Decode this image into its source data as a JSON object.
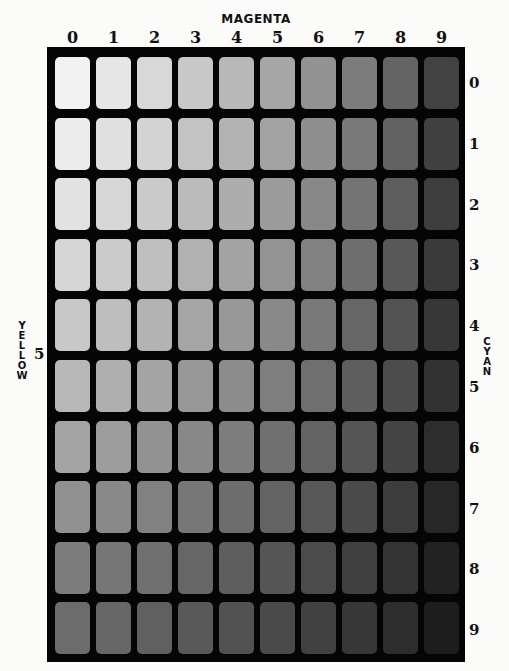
{
  "title": "MAGENTA",
  "columns": {
    "axis": "MAGENTA",
    "labels": [
      "0",
      "1",
      "2",
      "3",
      "4",
      "5",
      "6",
      "7",
      "8",
      "9"
    ]
  },
  "rows": {
    "axis": "CYAN",
    "labels": [
      "0",
      "1",
      "2",
      "3",
      "4",
      "5",
      "6",
      "7",
      "8",
      "9"
    ]
  },
  "left_axis": {
    "label": "YELLOW",
    "value": "5"
  },
  "right_axis_label": "CYAN",
  "frame_color": "#050505",
  "background_color": "#fbfbfa",
  "grid_gray_values": [
    [
      242,
      230,
      216,
      200,
      184,
      166,
      146,
      124,
      100,
      66
    ],
    [
      236,
      224,
      211,
      195,
      179,
      162,
      142,
      121,
      98,
      64
    ],
    [
      226,
      215,
      202,
      187,
      172,
      155,
      136,
      116,
      93,
      62
    ],
    [
      214,
      203,
      191,
      177,
      163,
      147,
      129,
      110,
      88,
      58
    ],
    [
      200,
      190,
      179,
      165,
      152,
      137,
      121,
      102,
      83,
      55
    ],
    [
      184,
      175,
      164,
      152,
      140,
      126,
      111,
      94,
      76,
      50
    ],
    [
      164,
      156,
      146,
      136,
      125,
      112,
      99,
      84,
      68,
      45
    ],
    [
      144,
      137,
      129,
      119,
      109,
      99,
      87,
      74,
      60,
      39
    ],
    [
      124,
      118,
      111,
      102,
      94,
      85,
      75,
      64,
      51,
      34
    ],
    [
      108,
      103,
      96,
      89,
      82,
      74,
      65,
      55,
      45,
      29
    ]
  ],
  "chart_data": {
    "type": "heatmap",
    "title": "MAGENTA",
    "xlabel": "MAGENTA",
    "ylabel": "CYAN",
    "annotation": "YELLOW 5",
    "x": [
      "0",
      "1",
      "2",
      "3",
      "4",
      "5",
      "6",
      "7",
      "8",
      "9"
    ],
    "y": [
      "0",
      "1",
      "2",
      "3",
      "4",
      "5",
      "6",
      "7",
      "8",
      "9"
    ],
    "values_gray_0_255": [
      [
        242,
        230,
        216,
        200,
        184,
        166,
        146,
        124,
        100,
        66
      ],
      [
        236,
        224,
        211,
        195,
        179,
        162,
        142,
        121,
        98,
        64
      ],
      [
        226,
        215,
        202,
        187,
        172,
        155,
        136,
        116,
        93,
        62
      ],
      [
        214,
        203,
        191,
        177,
        163,
        147,
        129,
        110,
        88,
        58
      ],
      [
        200,
        190,
        179,
        165,
        152,
        137,
        121,
        102,
        83,
        55
      ],
      [
        184,
        175,
        164,
        152,
        140,
        126,
        111,
        94,
        76,
        50
      ],
      [
        164,
        156,
        146,
        136,
        125,
        112,
        99,
        84,
        68,
        45
      ],
      [
        144,
        137,
        129,
        119,
        109,
        99,
        87,
        74,
        60,
        39
      ],
      [
        124,
        118,
        111,
        102,
        94,
        85,
        75,
        64,
        51,
        34
      ],
      [
        108,
        103,
        96,
        89,
        82,
        74,
        65,
        55,
        45,
        29
      ]
    ],
    "grid": false,
    "legend": "none"
  }
}
